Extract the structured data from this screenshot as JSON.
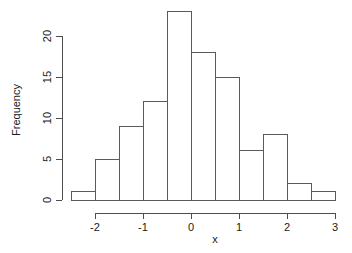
{
  "chart_data": {
    "type": "bar",
    "title": "",
    "xlabel": "x",
    "ylabel": "Frequency",
    "bin_width": 0.5,
    "bin_edges": [
      -2.5,
      -2.0,
      -1.5,
      -1.0,
      -0.5,
      0.0,
      0.5,
      1.0,
      1.5,
      2.0,
      2.5,
      3.0
    ],
    "categories": [
      "-2.5",
      "-2.0",
      "-1.5",
      "-1.0",
      "-0.5",
      "0.0",
      "0.5",
      "1.0",
      "1.5",
      "2.0",
      "2.5"
    ],
    "values": [
      1,
      5,
      9,
      12,
      23,
      18,
      15,
      6,
      8,
      2,
      1
    ],
    "bars": [
      {
        "x0": -2.5,
        "x1": -2.0,
        "value": 1
      },
      {
        "x0": -2.0,
        "x1": -1.5,
        "value": 5
      },
      {
        "x0": -1.5,
        "x1": -1.0,
        "value": 9
      },
      {
        "x0": -1.0,
        "x1": -0.5,
        "value": 12
      },
      {
        "x0": -0.5,
        "x1": 0.0,
        "value": 23
      },
      {
        "x0": 0.0,
        "x1": 0.5,
        "value": 18
      },
      {
        "x0": 0.5,
        "x1": 1.0,
        "value": 15
      },
      {
        "x0": 1.0,
        "x1": 1.5,
        "value": 6
      },
      {
        "x0": 1.5,
        "x1": 2.0,
        "value": 8
      },
      {
        "x0": 2.0,
        "x1": 2.5,
        "value": 2
      },
      {
        "x0": 2.5,
        "x1": 3.0,
        "value": 1
      }
    ],
    "xticks": [
      -2,
      -1,
      0,
      1,
      2,
      3
    ],
    "xtick_labels": [
      "-2",
      "-1",
      "0",
      "1",
      "2",
      "3"
    ],
    "yticks": [
      0,
      5,
      10,
      15,
      20
    ],
    "ytick_labels": [
      "0",
      "5",
      "10",
      "15",
      "20"
    ],
    "xlim": [
      -2.5,
      3.0
    ],
    "ylim": [
      0,
      23
    ],
    "grid": false,
    "legend": null,
    "bar_fill_color": "#ffffff",
    "bar_stroke_color": "#5a5a5a",
    "axis_color": "#4d4d4d",
    "text_color": "#1a1a1a",
    "background_color": "#ffffff"
  }
}
